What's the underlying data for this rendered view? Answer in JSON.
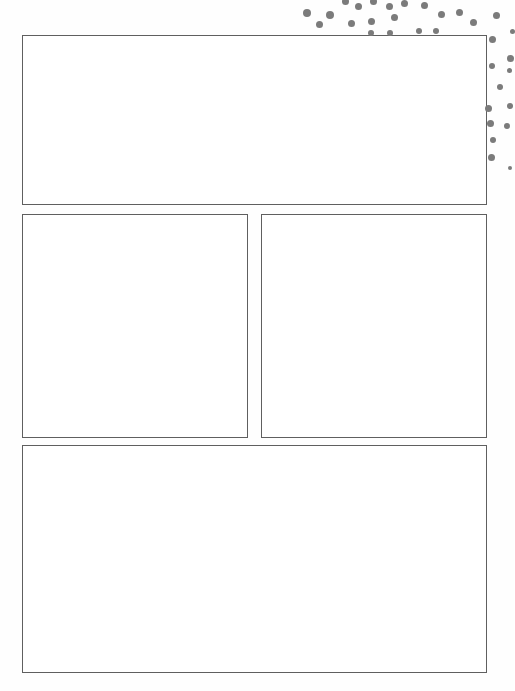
{
  "page": {
    "type": "blank-comic-template",
    "background": "#ffffff",
    "border_color": "#5f5f5f",
    "dot_color": "#7b7b7b"
  },
  "panels": [
    {
      "id": "panel-1",
      "x": 22,
      "y": 35,
      "w": 465,
      "h": 170
    },
    {
      "id": "panel-2",
      "x": 22,
      "y": 214,
      "w": 226,
      "h": 224
    },
    {
      "id": "panel-3",
      "x": 261,
      "y": 214,
      "w": 226,
      "h": 224
    },
    {
      "id": "panel-4",
      "x": 22,
      "y": 445,
      "w": 465,
      "h": 228
    }
  ],
  "dots": [
    [
      307,
      13,
      8
    ],
    [
      330,
      15,
      8
    ],
    [
      319,
      24,
      7
    ],
    [
      345,
      1,
      7
    ],
    [
      358,
      6,
      7
    ],
    [
      373,
      1,
      7
    ],
    [
      389,
      6,
      7
    ],
    [
      404,
      3,
      7
    ],
    [
      351,
      23,
      7
    ],
    [
      371,
      21,
      7
    ],
    [
      394,
      17,
      7
    ],
    [
      424,
      5,
      7
    ],
    [
      441,
      14,
      7
    ],
    [
      459,
      12,
      7
    ],
    [
      473,
      22,
      7
    ],
    [
      496,
      15,
      7
    ],
    [
      371,
      33,
      6
    ],
    [
      390,
      33,
      6
    ],
    [
      419,
      31,
      6
    ],
    [
      436,
      31,
      6
    ],
    [
      492,
      39,
      7
    ],
    [
      512,
      31,
      5
    ],
    [
      492,
      66,
      6
    ],
    [
      510,
      58,
      7
    ],
    [
      509,
      70,
      5
    ],
    [
      500,
      87,
      6
    ],
    [
      488,
      108,
      7
    ],
    [
      510,
      106,
      6
    ],
    [
      490,
      123,
      7
    ],
    [
      507,
      126,
      6
    ],
    [
      493,
      140,
      6
    ],
    [
      491,
      157,
      7
    ],
    [
      510,
      168,
      4
    ]
  ]
}
